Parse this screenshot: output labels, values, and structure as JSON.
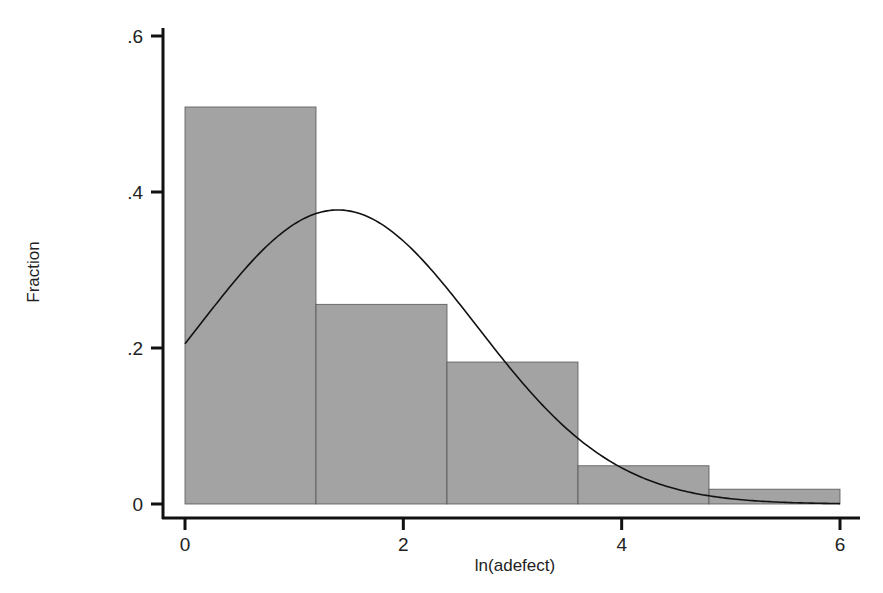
{
  "chart_data": {
    "type": "bar",
    "subtype": "histogram_with_normal_density",
    "title": "",
    "xlabel": "ln(adefect)",
    "ylabel": "Fraction",
    "xlim": [
      0,
      6
    ],
    "ylim": [
      0,
      0.6
    ],
    "x_ticks": [
      0,
      2,
      4,
      6
    ],
    "x_tick_labels": [
      "0",
      "2",
      "4",
      "6"
    ],
    "y_ticks": [
      0,
      0.2,
      0.4,
      0.6
    ],
    "y_tick_labels": [
      "0",
      ".2",
      ".4",
      ".6"
    ],
    "grid": false,
    "legend": null,
    "bins": [
      {
        "start": 0.0,
        "end": 1.2,
        "value": 0.509
      },
      {
        "start": 1.2,
        "end": 2.4,
        "value": 0.256
      },
      {
        "start": 2.4,
        "end": 3.6,
        "value": 0.182
      },
      {
        "start": 3.6,
        "end": 4.8,
        "value": 0.049
      },
      {
        "start": 4.8,
        "end": 6.0,
        "value": 0.019
      }
    ],
    "categories": [
      "0–1.2",
      "1.2–2.4",
      "2.4–3.6",
      "3.6–4.8",
      "4.8–6.0"
    ],
    "values": [
      0.509,
      0.256,
      0.182,
      0.049,
      0.019
    ],
    "overlay_curve": {
      "type": "normal_density",
      "mean": 1.4,
      "sd": 1.27,
      "peak_fraction": 0.377,
      "x_range": [
        0,
        6
      ]
    },
    "colors": {
      "bar_fill": "#a3a3a3",
      "bar_edge": "#555555",
      "curve": "#111111",
      "axis": "#111111"
    }
  }
}
